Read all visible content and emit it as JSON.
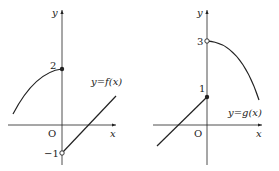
{
  "graph_f": {
    "y_axis_label": "y",
    "x_axis_label": "x",
    "origin_label": "O",
    "tick_top": "2",
    "tick_bottom": "−1",
    "function_label": "y=f(x)",
    "points": [
      {
        "x": 0,
        "y": 2,
        "filled": true
      },
      {
        "x": 0,
        "y": -1,
        "filled": false
      }
    ]
  },
  "graph_g": {
    "y_axis_label": "y",
    "x_axis_label": "x",
    "origin_label": "O",
    "tick_top": "3",
    "tick_mid": "1",
    "function_label": "y=g(x)",
    "points": [
      {
        "x": 0,
        "y": 3,
        "filled": false
      },
      {
        "x": 0,
        "y": 1,
        "filled": true
      }
    ]
  }
}
